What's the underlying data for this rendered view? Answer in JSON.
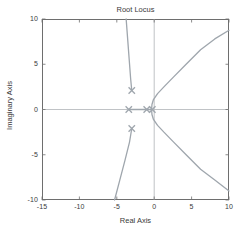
{
  "chart_data": {
    "type": "line",
    "title": "Root Locus",
    "xlabel": "Real Axis",
    "ylabel": "Imaginary Axis",
    "xlim": [
      -15,
      10
    ],
    "ylim": [
      -10,
      10
    ],
    "xticks": [
      -15,
      -10,
      -5,
      0,
      5,
      10
    ],
    "yticks": [
      -10,
      -5,
      0,
      5,
      10
    ],
    "xtick_labels": [
      "-15",
      "-10",
      "-5",
      "0",
      "5",
      "10"
    ],
    "ytick_labels": [
      "-10",
      "-5",
      "0",
      "5",
      "10"
    ],
    "grid": false,
    "legend": null,
    "series_color": "#9fa6ad",
    "axis_color": "#6e6e6e",
    "text_color": "#3a3a3a",
    "poles": [
      {
        "name": "complex-pole-upper",
        "re": -3.0,
        "im": 2.1,
        "marker": "x"
      },
      {
        "name": "complex-pole-lower",
        "re": -3.0,
        "im": -2.1,
        "marker": "x"
      },
      {
        "name": "real-pole-left",
        "re": -3.4,
        "im": 0.0,
        "marker": "x"
      },
      {
        "name": "real-pole-mid",
        "re": -1.0,
        "im": 0.0,
        "marker": "x"
      },
      {
        "name": "real-pole-origin",
        "re": -0.25,
        "im": 0.0,
        "marker": "x"
      }
    ],
    "branches": [
      {
        "name": "upper-left-asymptote",
        "points": [
          [
            -3.0,
            2.1
          ],
          [
            -3.15,
            3.4
          ],
          [
            -3.35,
            5.6
          ],
          [
            -3.55,
            7.8
          ],
          [
            -3.75,
            10.0
          ]
        ]
      },
      {
        "name": "lower-left-asymptote",
        "points": [
          [
            -3.0,
            -2.1
          ],
          [
            -3.3,
            -3.6
          ],
          [
            -3.9,
            -5.6
          ],
          [
            -4.6,
            -7.8
          ],
          [
            -5.3,
            -10.0
          ]
        ]
      },
      {
        "name": "upper-right-asymptote",
        "points": [
          [
            -0.35,
            0.0
          ],
          [
            -0.3,
            0.55
          ],
          [
            -0.1,
            1.1
          ],
          [
            0.45,
            1.75
          ],
          [
            1.3,
            2.5
          ],
          [
            2.6,
            3.6
          ],
          [
            4.2,
            4.95
          ],
          [
            6.2,
            6.6
          ],
          [
            8.1,
            7.8
          ],
          [
            10.0,
            8.75
          ]
        ]
      },
      {
        "name": "lower-right-asymptote",
        "points": [
          [
            -0.35,
            0.0
          ],
          [
            -0.3,
            -0.55
          ],
          [
            -0.1,
            -1.1
          ],
          [
            0.45,
            -1.75
          ],
          [
            1.3,
            -2.5
          ],
          [
            2.6,
            -3.6
          ],
          [
            4.2,
            -4.95
          ],
          [
            6.2,
            -6.6
          ],
          [
            8.1,
            -7.8
          ],
          [
            10.0,
            -9.0
          ]
        ]
      },
      {
        "name": "real-axis-segment",
        "points": [
          [
            -3.4,
            0.0
          ],
          [
            -2.2,
            0.0
          ],
          [
            -1.0,
            0.0
          ]
        ]
      },
      {
        "name": "real-axis-segment-origin",
        "points": [
          [
            -1.0,
            0.0
          ],
          [
            -0.6,
            0.0
          ],
          [
            -0.25,
            0.0
          ]
        ]
      }
    ],
    "axis_lines": {
      "x_zero": true,
      "y_zero": true,
      "zero_line_color": "#b9bcc0"
    }
  }
}
